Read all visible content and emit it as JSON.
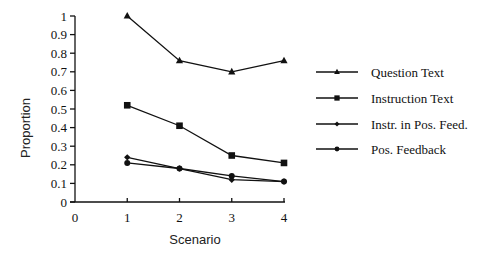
{
  "chart_data": {
    "type": "line",
    "title": "",
    "xlabel": "Scenario",
    "ylabel": "Proportion",
    "x": [
      1,
      2,
      3,
      4
    ],
    "x_ticks": [
      "0",
      "1",
      "2",
      "3",
      "4"
    ],
    "y_ticks": [
      "0",
      "0.1",
      "0.2",
      "0.3",
      "0.4",
      "0.5",
      "0.6",
      "0.7",
      "0.8",
      "0.9",
      "1"
    ],
    "xlim": [
      0,
      4
    ],
    "ylim": [
      0,
      1
    ],
    "grid": false,
    "legend_position": "right",
    "series": [
      {
        "name": "Question Text",
        "marker": "triangle",
        "values": [
          1.0,
          0.76,
          0.7,
          0.76
        ]
      },
      {
        "name": "Instruction Text",
        "marker": "square",
        "values": [
          0.52,
          0.41,
          0.25,
          0.21
        ]
      },
      {
        "name": "Instr. in Pos. Feed.",
        "marker": "diamond",
        "values": [
          0.24,
          0.18,
          0.12,
          0.11
        ]
      },
      {
        "name": "Pos. Feedback",
        "marker": "circle",
        "values": [
          0.21,
          0.18,
          0.14,
          0.11
        ]
      }
    ]
  },
  "colors": {
    "ink": "#111111",
    "background": "#ffffff"
  }
}
